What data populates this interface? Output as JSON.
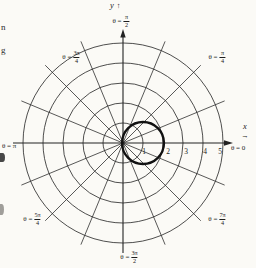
{
  "figure": {
    "background": "#fbfaf6",
    "ink": "#222222",
    "curve_ink": "#111111",
    "labels": {
      "y_axis": {
        "var": "y",
        "arrow": "↑"
      },
      "x_axis": {
        "var": "x",
        "arrow": "→"
      },
      "theta_90": {
        "prefix": "θ =",
        "num": "π",
        "den": "2"
      },
      "theta_135": {
        "prefix": "θ =",
        "num": "3π",
        "den": "4"
      },
      "theta_45": {
        "prefix": "θ =",
        "num": "π",
        "den": "4"
      },
      "theta_180": {
        "text": "θ = π"
      },
      "theta_0": {
        "text": "θ = 0"
      },
      "theta_225": {
        "prefix": "θ =",
        "num": "5π",
        "den": "4"
      },
      "theta_315": {
        "prefix": "θ =",
        "num": "7π",
        "den": "4"
      },
      "theta_270": {
        "prefix": "θ =",
        "num": "3π",
        "den": "2"
      }
    },
    "ticks": [
      "1",
      "2",
      "3",
      "4",
      "5"
    ],
    "stray_text": {
      "line1": "n",
      "line2": "g"
    }
  },
  "chart_data": {
    "type": "line",
    "subtype": "polar",
    "polar_grid": {
      "center_px": [
        123,
        143
      ],
      "unit_px": 20,
      "ring_radii_units": [
        1,
        2,
        3,
        4,
        5
      ],
      "radial_step_deg": 22.5,
      "radial_count": 16,
      "radial_extent_units": 5.5,
      "axis_right_end_px": [
        226,
        143
      ],
      "axis_top_end_px": [
        123,
        37
      ],
      "axis_left_end_px": [
        13,
        143
      ],
      "axis_bottom_end_px": [
        123,
        253
      ]
    },
    "axes": {
      "x_label": "x",
      "y_label": "y",
      "x_tick_values": [
        1,
        2,
        3,
        4,
        5
      ],
      "theta_labels_deg": [
        0,
        45,
        90,
        135,
        180,
        225,
        270,
        315
      ],
      "grid": true,
      "legend": false
    },
    "curve": {
      "equation": "r = 2 cos(θ)",
      "shape": "circle",
      "center_units": [
        1,
        0
      ],
      "radius_units": 1,
      "radius_px": 21,
      "stroke_width_px": 2.3
    }
  }
}
